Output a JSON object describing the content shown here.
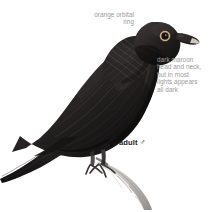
{
  "plate": {
    "background_color": "#ffffff",
    "width": 214,
    "height": 212,
    "subject": "perched dark pigeon, side view facing upper right"
  },
  "annotations": {
    "orbital_ring": {
      "text": "orange orbital\nring",
      "color": "#9a9a9a",
      "align": "right"
    },
    "maroon_head": {
      "text": "dark maroon\nhead and neck,\nbut in most\nlights appears\nall dark",
      "color": "#9a9a9a",
      "align": "left"
    }
  },
  "labels": {
    "age_sex": {
      "age": "adult",
      "sex_symbol": "♂",
      "color": "#1c1c1c"
    }
  },
  "illustration": {
    "colors": {
      "body_dark": "#242222",
      "body_darker": "#131212",
      "body_mid": "#3a3636",
      "body_highlight": "#585252",
      "neck_scale": "#4a4444",
      "orbital_ring": "#d8b08a",
      "eye_pupil": "#141212",
      "bill_dark": "#2a2626",
      "bill_tip": "#cdc6bf",
      "leg_dark": "#4a4545",
      "branch_light": "#d6d4d2",
      "branch_mid": "#b0adab",
      "branch_shadow": "#8d8a88"
    },
    "parts": [
      "head",
      "eye",
      "orbital-ring",
      "bill",
      "neck",
      "back",
      "wing",
      "breast",
      "belly",
      "tail",
      "legs",
      "feet",
      "branch"
    ]
  }
}
